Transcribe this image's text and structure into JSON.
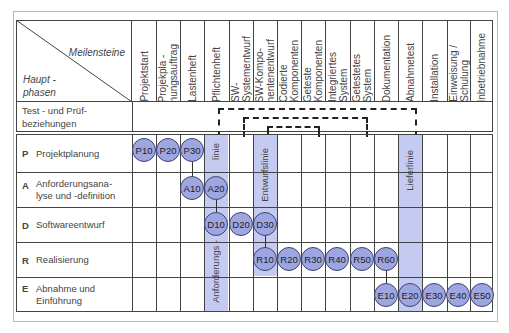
{
  "diagram": {
    "header": {
      "milestones_label": "Meilensteine",
      "phases_label": "Haupt -\nphasen"
    },
    "milestones": [
      "Projektstart",
      "Projekpla -\nnungsauftrag",
      "Lastenheft",
      "Pflichtenheft",
      "SW-Systementwurf",
      "SW-Kompo-\nnentenentwurf",
      "Codierte\nKomponenten",
      "Geteste\nKomponenten",
      "Integriertes\nSystem",
      "Getestetes\nSystem",
      "Dokumentation",
      "Abnahmetest",
      "Installation",
      "Einweisung /\nSchulung",
      "Inbetriebnahme"
    ],
    "test_row_label": "Test - und Prüf-\nbeziehungen",
    "phases": [
      {
        "key": "P",
        "label": "Projektplanung"
      },
      {
        "key": "A",
        "label": "Anforderungsana-\nlyse und -definition"
      },
      {
        "key": "D",
        "label": "Softwareentwurf"
      },
      {
        "key": "R",
        "label": "Realisierung"
      },
      {
        "key": "E",
        "label": "Abnahme und\nEinführung"
      }
    ],
    "lines": {
      "anforderungslinie_bottom": "Anforderungs -",
      "anforderungslinie_top": "linie",
      "entwurfslinie": "Entwurfslinie",
      "lieferlinie": "Lieferlinie"
    },
    "nodes": {
      "P": [
        "P10",
        "P20",
        "P30"
      ],
      "A": [
        "A10",
        "A20"
      ],
      "D": [
        "D10",
        "D20",
        "D30"
      ],
      "R": [
        "R10",
        "R20",
        "R30",
        "R40",
        "R50",
        "R60"
      ],
      "E": [
        "E10",
        "E20",
        "E30",
        "E40",
        "E50"
      ]
    },
    "colors": {
      "node_fill": "#9ea6e2",
      "node_border": "#3c4470",
      "band_fill": "#c5cbf0",
      "grid": "#444444"
    }
  }
}
